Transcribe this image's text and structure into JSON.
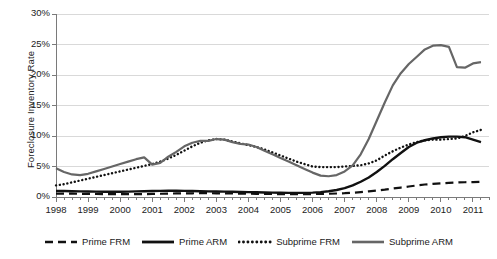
{
  "chart_data": {
    "type": "line",
    "title": "",
    "subtitle": "",
    "xlabel": "",
    "ylabel": "Foreclosure Inventory Rate",
    "xlim": [
      1998.0,
      2011.5
    ],
    "ylim": [
      0,
      30
    ],
    "ytick_labels": [
      "0%",
      "5%",
      "10%",
      "15%",
      "20%",
      "25%",
      "30%"
    ],
    "ytick_values": [
      0,
      5,
      10,
      15,
      20,
      25,
      30
    ],
    "xtick_labels": [
      "1998",
      "1999",
      "2000",
      "2001",
      "2002",
      "2003",
      "2004",
      "2005",
      "2006",
      "2007",
      "2008",
      "2009",
      "2010",
      "2011"
    ],
    "xtick_values": [
      1998,
      1999,
      2000,
      2001,
      2002,
      2003,
      2004,
      2005,
      2006,
      2007,
      2008,
      2009,
      2010,
      2011
    ],
    "grid": "horizontal",
    "legend_position": "bottom",
    "minor_ticks_per_year": 4,
    "series": [
      {
        "name": "Prime FRM",
        "style": "dashed",
        "color": "#111111",
        "width": 2.2,
        "x": [
          1998.0,
          1998.25,
          1998.5,
          1998.75,
          1999.0,
          1999.25,
          1999.5,
          1999.75,
          2000.0,
          2000.25,
          2000.5,
          2000.75,
          2001.0,
          2001.25,
          2001.5,
          2001.75,
          2002.0,
          2002.25,
          2002.5,
          2002.75,
          2003.0,
          2003.25,
          2003.5,
          2003.75,
          2004.0,
          2004.25,
          2004.5,
          2004.75,
          2005.0,
          2005.25,
          2005.5,
          2005.75,
          2006.0,
          2006.25,
          2006.5,
          2006.75,
          2007.0,
          2007.25,
          2007.5,
          2007.75,
          2008.0,
          2008.25,
          2008.5,
          2008.75,
          2009.0,
          2009.25,
          2009.5,
          2009.75,
          2010.0,
          2010.25,
          2010.5,
          2010.75,
          2011.0,
          2011.25
        ],
        "values": [
          0.55,
          0.55,
          0.54,
          0.53,
          0.52,
          0.5,
          0.48,
          0.47,
          0.46,
          0.46,
          0.47,
          0.48,
          0.5,
          0.53,
          0.56,
          0.58,
          0.6,
          0.61,
          0.62,
          0.62,
          0.61,
          0.6,
          0.58,
          0.56,
          0.54,
          0.52,
          0.5,
          0.49,
          0.48,
          0.47,
          0.47,
          0.47,
          0.48,
          0.5,
          0.53,
          0.57,
          0.62,
          0.7,
          0.8,
          0.92,
          1.05,
          1.2,
          1.38,
          1.55,
          1.72,
          1.9,
          2.05,
          2.15,
          2.25,
          2.32,
          2.38,
          2.42,
          2.45,
          2.5
        ]
      },
      {
        "name": "Prime ARM",
        "style": "solid",
        "color": "#111111",
        "width": 2.4,
        "x": [
          1998.0,
          1998.25,
          1998.5,
          1998.75,
          1999.0,
          1999.25,
          1999.5,
          1999.75,
          2000.0,
          2000.25,
          2000.5,
          2000.75,
          2001.0,
          2001.25,
          2001.5,
          2001.75,
          2002.0,
          2002.25,
          2002.5,
          2002.75,
          2003.0,
          2003.25,
          2003.5,
          2003.75,
          2004.0,
          2004.25,
          2004.5,
          2004.75,
          2005.0,
          2005.25,
          2005.5,
          2005.75,
          2006.0,
          2006.25,
          2006.5,
          2006.75,
          2007.0,
          2007.25,
          2007.5,
          2007.75,
          2008.0,
          2008.25,
          2008.5,
          2008.75,
          2009.0,
          2009.25,
          2009.5,
          2009.75,
          2010.0,
          2010.25,
          2010.5,
          2010.75,
          2011.0,
          2011.25
        ],
        "values": [
          1.0,
          0.98,
          0.95,
          0.92,
          0.9,
          0.88,
          0.86,
          0.85,
          0.85,
          0.88,
          0.92,
          0.95,
          0.98,
          1.0,
          1.02,
          1.02,
          1.0,
          0.98,
          0.95,
          0.93,
          0.9,
          0.88,
          0.85,
          0.82,
          0.8,
          0.78,
          0.75,
          0.72,
          0.7,
          0.68,
          0.67,
          0.68,
          0.72,
          0.8,
          0.95,
          1.15,
          1.45,
          1.9,
          2.5,
          3.2,
          4.1,
          5.1,
          6.2,
          7.2,
          8.2,
          8.9,
          9.3,
          9.6,
          9.8,
          9.9,
          9.9,
          9.8,
          9.4,
          9.0
        ]
      },
      {
        "name": "Subprime FRM",
        "style": "dotted",
        "color": "#111111",
        "width": 2.4,
        "x": [
          1998.0,
          1998.25,
          1998.5,
          1998.75,
          1999.0,
          1999.25,
          1999.5,
          1999.75,
          2000.0,
          2000.25,
          2000.5,
          2000.75,
          2001.0,
          2001.25,
          2001.5,
          2001.75,
          2002.0,
          2002.25,
          2002.5,
          2002.75,
          2003.0,
          2003.25,
          2003.5,
          2003.75,
          2004.0,
          2004.25,
          2004.5,
          2004.75,
          2005.0,
          2005.25,
          2005.5,
          2005.75,
          2006.0,
          2006.25,
          2006.5,
          2006.75,
          2007.0,
          2007.25,
          2007.5,
          2007.75,
          2008.0,
          2008.25,
          2008.5,
          2008.75,
          2009.0,
          2009.25,
          2009.5,
          2009.75,
          2010.0,
          2010.25,
          2010.5,
          2010.75,
          2011.0,
          2011.25
        ],
        "values": [
          1.9,
          2.1,
          2.4,
          2.7,
          3.0,
          3.3,
          3.6,
          3.9,
          4.2,
          4.5,
          4.8,
          5.1,
          5.4,
          5.8,
          6.3,
          6.9,
          7.6,
          8.3,
          8.9,
          9.3,
          9.5,
          9.4,
          9.1,
          8.8,
          8.5,
          8.2,
          7.8,
          7.3,
          6.8,
          6.3,
          5.8,
          5.4,
          5.0,
          4.9,
          4.9,
          4.9,
          5.0,
          5.1,
          5.2,
          5.5,
          6.0,
          6.8,
          7.5,
          8.1,
          8.6,
          9.0,
          9.3,
          9.4,
          9.4,
          9.5,
          9.6,
          10.0,
          10.6,
          11.0
        ]
      },
      {
        "name": "Subprime ARM",
        "style": "solid",
        "color": "#666666",
        "width": 2.2,
        "x": [
          1998.0,
          1998.25,
          1998.5,
          1998.75,
          1999.0,
          1999.25,
          1999.5,
          1999.75,
          2000.0,
          2000.25,
          2000.5,
          2000.75,
          2001.0,
          2001.25,
          2001.5,
          2001.75,
          2002.0,
          2002.25,
          2002.5,
          2002.75,
          2003.0,
          2003.25,
          2003.5,
          2003.75,
          2004.0,
          2004.25,
          2004.5,
          2004.75,
          2005.0,
          2005.25,
          2005.5,
          2005.75,
          2006.0,
          2006.25,
          2006.5,
          2006.75,
          2007.0,
          2007.25,
          2007.5,
          2007.75,
          2008.0,
          2008.25,
          2008.5,
          2008.75,
          2009.0,
          2009.25,
          2009.5,
          2009.75,
          2010.0,
          2010.25,
          2010.5,
          2010.75,
          2011.0,
          2011.25
        ],
        "values": [
          4.7,
          4.1,
          3.7,
          3.6,
          3.8,
          4.2,
          4.6,
          5.0,
          5.4,
          5.8,
          6.2,
          6.5,
          5.3,
          5.6,
          6.6,
          7.4,
          8.3,
          8.9,
          9.2,
          9.2,
          9.5,
          9.4,
          9.0,
          8.7,
          8.6,
          8.2,
          7.6,
          7.0,
          6.4,
          5.8,
          5.2,
          4.6,
          4.0,
          3.5,
          3.4,
          3.6,
          4.2,
          5.2,
          7.0,
          9.5,
          12.5,
          15.5,
          18.3,
          20.3,
          21.8,
          23.0,
          24.2,
          24.8,
          24.9,
          24.6,
          21.3,
          21.2,
          21.9,
          22.1
        ]
      }
    ]
  },
  "axes": {
    "ylabel": "Foreclosure Inventory Rate"
  }
}
